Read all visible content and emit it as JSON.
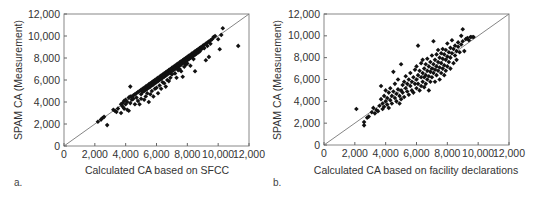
{
  "chart_data": [
    {
      "type": "scatter",
      "panel_label": "a.",
      "title": "",
      "xlabel": "Calculated CA based on SFCC",
      "ylabel": "SPAM CA (Measurement)",
      "xlim": [
        0,
        12000
      ],
      "ylim": [
        0,
        12000
      ],
      "xticks": [
        0,
        2000,
        4000,
        6000,
        8000,
        10000,
        12000
      ],
      "yticks": [
        0,
        2000,
        4000,
        6000,
        8000,
        10000,
        12000
      ],
      "xtick_labels": [
        "0",
        "2,000",
        "4,000",
        "6,000",
        "8,000",
        "10,000",
        "12,000"
      ],
      "ytick_labels": [
        "0",
        "2,000",
        "4,000",
        "6,000",
        "8,000",
        "10,000",
        "12,000"
      ],
      "grid": false,
      "reference_line": {
        "label": "y = x",
        "from": [
          0,
          0
        ],
        "to": [
          12000,
          12000
        ]
      },
      "marker": "filled diamond",
      "marker_color": "#111111",
      "points": [
        [
          2200,
          2200
        ],
        [
          2400,
          2400
        ],
        [
          2500,
          2550
        ],
        [
          2600,
          2650
        ],
        [
          2800,
          1900
        ],
        [
          3200,
          3300
        ],
        [
          3300,
          3200
        ],
        [
          3400,
          3100
        ],
        [
          3500,
          3400
        ],
        [
          3700,
          3800
        ],
        [
          3700,
          3000
        ],
        [
          3800,
          3900
        ],
        [
          3800,
          3600
        ],
        [
          3900,
          4100
        ],
        [
          3900,
          3400
        ],
        [
          4000,
          4200
        ],
        [
          4000,
          3800
        ],
        [
          4100,
          4000
        ],
        [
          4100,
          3300
        ],
        [
          4200,
          4400
        ],
        [
          4200,
          3200
        ],
        [
          4300,
          5400
        ],
        [
          4300,
          4500
        ],
        [
          4300,
          3900
        ],
        [
          4400,
          4500
        ],
        [
          4400,
          4200
        ],
        [
          4500,
          4600
        ],
        [
          4500,
          4300
        ],
        [
          4600,
          4700
        ],
        [
          4600,
          3800
        ],
        [
          4700,
          4800
        ],
        [
          4700,
          4400
        ],
        [
          4800,
          4900
        ],
        [
          4800,
          4100
        ],
        [
          4900,
          5000
        ],
        [
          4900,
          3800
        ],
        [
          5000,
          5100
        ],
        [
          5000,
          4700
        ],
        [
          5000,
          4300
        ],
        [
          5100,
          5200
        ],
        [
          5100,
          4900
        ],
        [
          5200,
          5300
        ],
        [
          5200,
          5000
        ],
        [
          5200,
          4200
        ],
        [
          5300,
          5400
        ],
        [
          5300,
          5100
        ],
        [
          5300,
          4500
        ],
        [
          5400,
          5500
        ],
        [
          5400,
          5200
        ],
        [
          5400,
          4800
        ],
        [
          5500,
          5600
        ],
        [
          5500,
          5300
        ],
        [
          5500,
          4000
        ],
        [
          5600,
          5700
        ],
        [
          5600,
          5400
        ],
        [
          5600,
          4700
        ],
        [
          5700,
          5800
        ],
        [
          5700,
          5500
        ],
        [
          5700,
          5000
        ],
        [
          5800,
          5900
        ],
        [
          5800,
          5600
        ],
        [
          5800,
          4500
        ],
        [
          5900,
          6000
        ],
        [
          5900,
          5700
        ],
        [
          5900,
          5200
        ],
        [
          6000,
          6100
        ],
        [
          6000,
          5800
        ],
        [
          6000,
          5300
        ],
        [
          6100,
          6200
        ],
        [
          6100,
          5900
        ],
        [
          6100,
          4800
        ],
        [
          6200,
          6300
        ],
        [
          6200,
          6000
        ],
        [
          6200,
          5500
        ],
        [
          6300,
          6400
        ],
        [
          6300,
          6100
        ],
        [
          6300,
          5200
        ],
        [
          6400,
          6500
        ],
        [
          6400,
          6200
        ],
        [
          6400,
          5800
        ],
        [
          6500,
          6600
        ],
        [
          6500,
          6300
        ],
        [
          6500,
          5700
        ],
        [
          6600,
          6700
        ],
        [
          6600,
          6400
        ],
        [
          6600,
          5400
        ],
        [
          6700,
          6800
        ],
        [
          6700,
          6500
        ],
        [
          6700,
          6000
        ],
        [
          6800,
          6900
        ],
        [
          6800,
          6600
        ],
        [
          6800,
          5900
        ],
        [
          6900,
          7000
        ],
        [
          6900,
          6700
        ],
        [
          6900,
          6200
        ],
        [
          7000,
          7100
        ],
        [
          7000,
          6800
        ],
        [
          7000,
          6500
        ],
        [
          7100,
          7200
        ],
        [
          7100,
          6900
        ],
        [
          7200,
          7300
        ],
        [
          7200,
          7000
        ],
        [
          7200,
          6600
        ],
        [
          7300,
          7400
        ],
        [
          7300,
          7100
        ],
        [
          7300,
          6200
        ],
        [
          7400,
          7500
        ],
        [
          7400,
          7200
        ],
        [
          7400,
          6900
        ],
        [
          7500,
          7600
        ],
        [
          7500,
          7300
        ],
        [
          7500,
          7000
        ],
        [
          7600,
          7700
        ],
        [
          7600,
          7400
        ],
        [
          7600,
          6800
        ],
        [
          7700,
          7800
        ],
        [
          7700,
          7500
        ],
        [
          7700,
          6300
        ],
        [
          7800,
          7900
        ],
        [
          7800,
          7600
        ],
        [
          7800,
          7200
        ],
        [
          7900,
          8000
        ],
        [
          7900,
          7700
        ],
        [
          7900,
          7400
        ],
        [
          8000,
          8100
        ],
        [
          8000,
          7800
        ],
        [
          8000,
          7500
        ],
        [
          8100,
          8200
        ],
        [
          8100,
          7900
        ],
        [
          8200,
          8300
        ],
        [
          8200,
          8000
        ],
        [
          8200,
          7300
        ],
        [
          8300,
          8400
        ],
        [
          8300,
          8100
        ],
        [
          8400,
          8500
        ],
        [
          8400,
          8200
        ],
        [
          8400,
          7900
        ],
        [
          8500,
          8600
        ],
        [
          8500,
          8300
        ],
        [
          8500,
          6800
        ],
        [
          8600,
          8700
        ],
        [
          8600,
          8400
        ],
        [
          8700,
          8800
        ],
        [
          8700,
          8500
        ],
        [
          8800,
          8900
        ],
        [
          8800,
          8600
        ],
        [
          8900,
          9000
        ],
        [
          8900,
          8800
        ],
        [
          9000,
          9100
        ],
        [
          9000,
          8900
        ],
        [
          9100,
          9200
        ],
        [
          9100,
          8900
        ],
        [
          9200,
          9300
        ],
        [
          9200,
          7800
        ],
        [
          9300,
          9400
        ],
        [
          9300,
          9100
        ],
        [
          9400,
          9500
        ],
        [
          9400,
          8100
        ],
        [
          9500,
          9600
        ],
        [
          9500,
          9300
        ],
        [
          9600,
          9700
        ],
        [
          9700,
          9900
        ],
        [
          9800,
          10000
        ],
        [
          10000,
          9700
        ],
        [
          10100,
          8800
        ],
        [
          10200,
          10100
        ],
        [
          10300,
          10700
        ],
        [
          11300,
          9100
        ]
      ]
    },
    {
      "type": "scatter",
      "panel_label": "b.",
      "title": "",
      "xlabel": "Calculated CA based on facility declarations",
      "ylabel": "SPAM CA (Measurement)",
      "xlim": [
        0,
        12000
      ],
      "ylim": [
        0,
        12000
      ],
      "xticks": [
        0,
        2000,
        4000,
        6000,
        8000,
        10000,
        12000
      ],
      "yticks": [
        0,
        2000,
        4000,
        6000,
        8000,
        10000,
        12000
      ],
      "xtick_labels": [
        "0",
        "2,000",
        "4,000",
        "6,000",
        "8,000",
        "10,000",
        "12,000"
      ],
      "ytick_labels": [
        "0",
        "2,000",
        "4,000",
        "6,000",
        "8,000",
        "10,000",
        "12,000"
      ],
      "grid": false,
      "reference_line": {
        "label": "y = x",
        "from": [
          0,
          0
        ],
        "to": [
          12000,
          12000
        ]
      },
      "marker": "filled diamond",
      "marker_color": "#111111",
      "points": [
        [
          2100,
          3300
        ],
        [
          2600,
          2100
        ],
        [
          2600,
          1800
        ],
        [
          2800,
          2500
        ],
        [
          2900,
          2600
        ],
        [
          3100,
          3000
        ],
        [
          3200,
          3400
        ],
        [
          3300,
          2900
        ],
        [
          3400,
          3200
        ],
        [
          3500,
          3100
        ],
        [
          3600,
          3600
        ],
        [
          3700,
          4200
        ],
        [
          3700,
          5400
        ],
        [
          3800,
          3300
        ],
        [
          3800,
          3800
        ],
        [
          3900,
          4500
        ],
        [
          3900,
          3500
        ],
        [
          4000,
          4000
        ],
        [
          4000,
          5000
        ],
        [
          4100,
          3700
        ],
        [
          4100,
          4300
        ],
        [
          4200,
          4800
        ],
        [
          4200,
          3400
        ],
        [
          4300,
          4100
        ],
        [
          4300,
          5200
        ],
        [
          4400,
          4500
        ],
        [
          4400,
          3800
        ],
        [
          4500,
          4900
        ],
        [
          4500,
          6700
        ],
        [
          4600,
          4300
        ],
        [
          4600,
          5600
        ],
        [
          4700,
          4700
        ],
        [
          4700,
          4000
        ],
        [
          4800,
          5100
        ],
        [
          4800,
          6000
        ],
        [
          4900,
          4500
        ],
        [
          4900,
          3800
        ],
        [
          5000,
          5000
        ],
        [
          5000,
          7400
        ],
        [
          5000,
          4200
        ],
        [
          5100,
          5500
        ],
        [
          5100,
          4800
        ],
        [
          5200,
          5800
        ],
        [
          5200,
          4400
        ],
        [
          5300,
          5200
        ],
        [
          5300,
          6300
        ],
        [
          5400,
          4900
        ],
        [
          5400,
          5600
        ],
        [
          5500,
          6000
        ],
        [
          5500,
          4600
        ],
        [
          5600,
          5400
        ],
        [
          5600,
          6600
        ],
        [
          5700,
          5800
        ],
        [
          5700,
          5000
        ],
        [
          5800,
          6200
        ],
        [
          5800,
          4800
        ],
        [
          5900,
          5600
        ],
        [
          5900,
          6900
        ],
        [
          6000,
          6000
        ],
        [
          6000,
          5200
        ],
        [
          6000,
          7200
        ],
        [
          6100,
          9100
        ],
        [
          6100,
          6400
        ],
        [
          6100,
          5600
        ],
        [
          6200,
          6800
        ],
        [
          6200,
          5000
        ],
        [
          6300,
          6200
        ],
        [
          6300,
          7500
        ],
        [
          6300,
          5400
        ],
        [
          6400,
          6600
        ],
        [
          6400,
          5800
        ],
        [
          6400,
          7800
        ],
        [
          6500,
          7000
        ],
        [
          6500,
          6200
        ],
        [
          6500,
          5300
        ],
        [
          6600,
          7400
        ],
        [
          6600,
          6400
        ],
        [
          6600,
          5600
        ],
        [
          6700,
          6800
        ],
        [
          6700,
          7900
        ],
        [
          6700,
          6000
        ],
        [
          6800,
          7200
        ],
        [
          6800,
          6300
        ],
        [
          6800,
          5000
        ],
        [
          6900,
          7600
        ],
        [
          6900,
          6700
        ],
        [
          6900,
          5800
        ],
        [
          7000,
          7000
        ],
        [
          7000,
          8200
        ],
        [
          7000,
          6200
        ],
        [
          7100,
          9500
        ],
        [
          7100,
          7400
        ],
        [
          7100,
          6600
        ],
        [
          7200,
          7800
        ],
        [
          7200,
          6900
        ],
        [
          7200,
          5800
        ],
        [
          7300,
          8300
        ],
        [
          7300,
          7200
        ],
        [
          7300,
          6400
        ],
        [
          7400,
          7600
        ],
        [
          7400,
          8700
        ],
        [
          7400,
          6800
        ],
        [
          7500,
          8000
        ],
        [
          7500,
          7100
        ],
        [
          7500,
          6000
        ],
        [
          7600,
          8400
        ],
        [
          7600,
          7500
        ],
        [
          7600,
          6600
        ],
        [
          7700,
          7900
        ],
        [
          7700,
          8800
        ],
        [
          7700,
          7000
        ],
        [
          7800,
          8300
        ],
        [
          7800,
          7300
        ],
        [
          7800,
          6400
        ],
        [
          7900,
          8700
        ],
        [
          7900,
          7800
        ],
        [
          7900,
          6800
        ],
        [
          8000,
          8100
        ],
        [
          8000,
          9300
        ],
        [
          8000,
          7200
        ],
        [
          8100,
          8500
        ],
        [
          8100,
          7600
        ],
        [
          8200,
          8900
        ],
        [
          8200,
          8000
        ],
        [
          8200,
          7000
        ],
        [
          8300,
          8400
        ],
        [
          8300,
          9600
        ],
        [
          8400,
          8800
        ],
        [
          8400,
          7500
        ],
        [
          8500,
          9100
        ],
        [
          8500,
          8200
        ],
        [
          8600,
          8600
        ],
        [
          8600,
          7800
        ],
        [
          8700,
          9400
        ],
        [
          8700,
          9000
        ],
        [
          8800,
          8500
        ],
        [
          8900,
          10000
        ],
        [
          8900,
          9200
        ],
        [
          9000,
          10600
        ],
        [
          9000,
          9500
        ],
        [
          9100,
          8600
        ],
        [
          9200,
          9700
        ],
        [
          9300,
          9800
        ],
        [
          9400,
          9600
        ],
        [
          9500,
          9900
        ],
        [
          9600,
          9900
        ],
        [
          9700,
          9900
        ]
      ]
    }
  ]
}
